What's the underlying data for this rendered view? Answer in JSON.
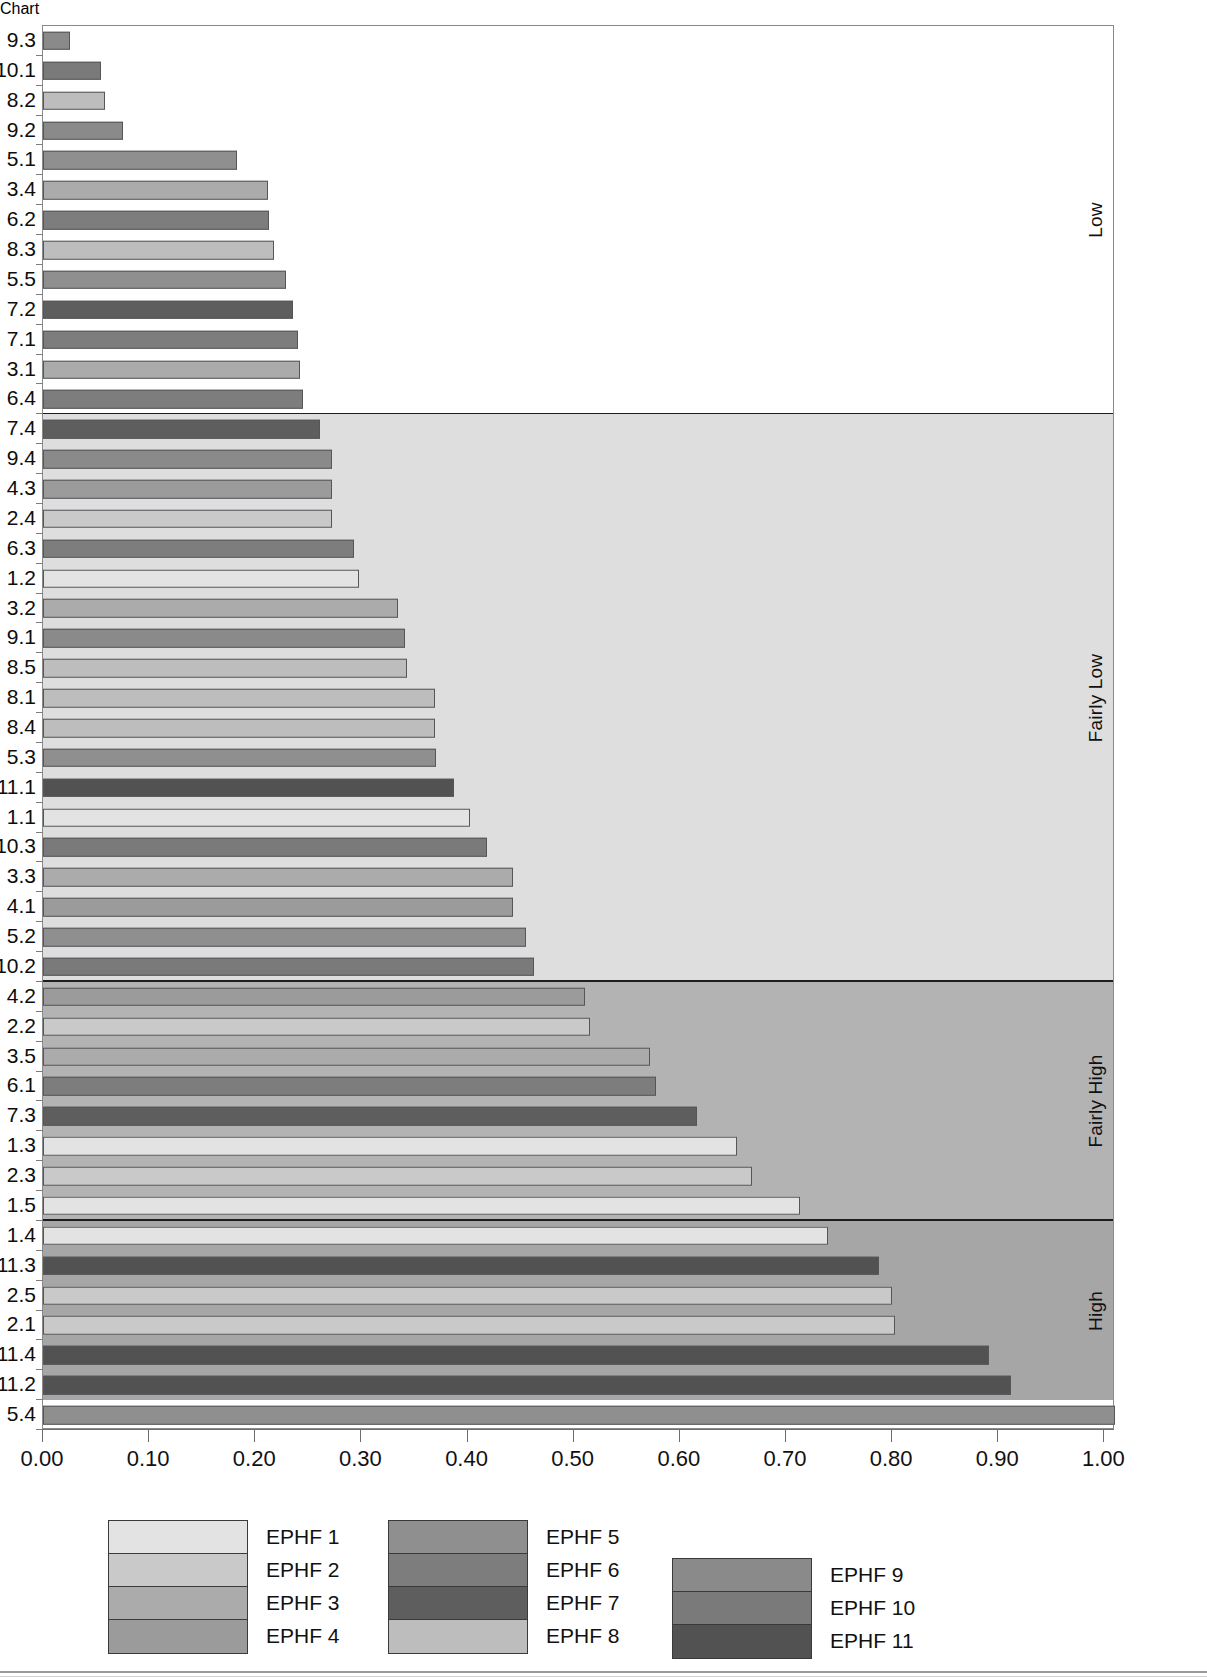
{
  "chart_data": {
    "type": "bar",
    "orientation": "horizontal",
    "title": "",
    "xlabel": "",
    "ylabel": "",
    "xlim": [
      0.0,
      1.01
    ],
    "grid": false,
    "legend_position": "bottom",
    "xticks": [
      "0.00",
      "0.10",
      "0.20",
      "0.30",
      "0.40",
      "0.50",
      "0.60",
      "0.70",
      "0.80",
      "0.90",
      "1.00"
    ],
    "xtick_values": [
      0.0,
      0.1,
      0.2,
      0.3,
      0.4,
      0.5,
      0.6,
      0.7,
      0.8,
      0.9,
      1.0
    ],
    "bands": [
      {
        "label": "Low",
        "color": "#ffffff",
        "count": 13
      },
      {
        "label": "Fairly Low",
        "color": "#dedede",
        "count": 19
      },
      {
        "label": "Fairly High",
        "color": "#b3b3b3",
        "count": 8
      },
      {
        "label": "High",
        "color": "#a6a6a6",
        "count": 6
      }
    ],
    "series_colors": {
      "EPHF 1": "#e3e3e3",
      "EPHF 2": "#c9c9c9",
      "EPHF 3": "#ababab",
      "EPHF 4": "#9b9b9b",
      "EPHF 5": "#8f8f8f",
      "EPHF 6": "#7d7d7d",
      "EPHF 7": "#5e5e5e",
      "EPHF 8": "#bdbdbd",
      "EPHF 9": "#8a8a8a",
      "EPHF 10": "#7a7a7a",
      "EPHF 11": "#525252"
    },
    "categories": [
      "9.3",
      "10.1",
      "8.2",
      "9.2",
      "5.1",
      "3.4",
      "6.2",
      "8.3",
      "5.5",
      "7.2",
      "7.1",
      "3.1",
      "6.4",
      "7.4",
      "9.4",
      "4.3",
      "2.4",
      "6.3",
      "1.2",
      "3.2",
      "9.1",
      "8.5",
      "8.1",
      "8.4",
      "5.3",
      "11.1",
      "1.1",
      "10.3",
      "3.3",
      "4.1",
      "5.2",
      "10.2",
      "4.2",
      "2.2",
      "3.5",
      "6.1",
      "7.3",
      "1.3",
      "2.3",
      "1.5",
      "1.4",
      "11.3",
      "2.5",
      "2.1",
      "11.4",
      "11.2",
      "5.4"
    ],
    "values": [
      0.025,
      0.055,
      0.058,
      0.075,
      0.183,
      0.212,
      0.213,
      0.218,
      0.229,
      0.236,
      0.24,
      0.242,
      0.245,
      0.261,
      0.272,
      0.272,
      0.272,
      0.293,
      0.298,
      0.334,
      0.341,
      0.343,
      0.369,
      0.369,
      0.37,
      0.387,
      0.402,
      0.418,
      0.443,
      0.443,
      0.455,
      0.463,
      0.511,
      0.515,
      0.572,
      0.578,
      0.616,
      0.654,
      0.668,
      0.713,
      0.74,
      0.788,
      0.8,
      0.803,
      0.891,
      0.912,
      1.01
    ],
    "series_of_bar": [
      "EPHF 9",
      "EPHF 10",
      "EPHF 8",
      "EPHF 9",
      "EPHF 5",
      "EPHF 3",
      "EPHF 6",
      "EPHF 8",
      "EPHF 5",
      "EPHF 7",
      "EPHF 6",
      "EPHF 3",
      "EPHF 6",
      "EPHF 7",
      "EPHF 9",
      "EPHF 4",
      "EPHF 2",
      "EPHF 6",
      "EPHF 1",
      "EPHF 3",
      "EPHF 9",
      "EPHF 8",
      "EPHF 8",
      "EPHF 8",
      "EPHF 5",
      "EPHF 11",
      "EPHF 1",
      "EPHF 10",
      "EPHF 3",
      "EPHF 4",
      "EPHF 5",
      "EPHF 10",
      "EPHF 4",
      "EPHF 2",
      "EPHF 3",
      "EPHF 6",
      "EPHF 7",
      "EPHF 1",
      "EPHF 2",
      "EPHF 1",
      "EPHF 1",
      "EPHF 11",
      "EPHF 2",
      "EPHF 2",
      "EPHF 11",
      "EPHF 11",
      "EPHF 5"
    ],
    "bars": [
      {
        "category": "9.3",
        "value": 0.025,
        "series": "EPHF 9",
        "band": "Low"
      },
      {
        "category": "10.1",
        "value": 0.055,
        "series": "EPHF 10",
        "band": "Low"
      },
      {
        "category": "8.2",
        "value": 0.058,
        "series": "EPHF 8",
        "band": "Low"
      },
      {
        "category": "9.2",
        "value": 0.075,
        "series": "EPHF 9",
        "band": "Low"
      },
      {
        "category": "5.1",
        "value": 0.183,
        "series": "EPHF 5",
        "band": "Low"
      },
      {
        "category": "3.4",
        "value": 0.212,
        "series": "EPHF 3",
        "band": "Low"
      },
      {
        "category": "6.2",
        "value": 0.213,
        "series": "EPHF 6",
        "band": "Low"
      },
      {
        "category": "8.3",
        "value": 0.218,
        "series": "EPHF 8",
        "band": "Low"
      },
      {
        "category": "5.5",
        "value": 0.229,
        "series": "EPHF 5",
        "band": "Low"
      },
      {
        "category": "7.2",
        "value": 0.236,
        "series": "EPHF 7",
        "band": "Low"
      },
      {
        "category": "7.1",
        "value": 0.24,
        "series": "EPHF 6",
        "band": "Low"
      },
      {
        "category": "3.1",
        "value": 0.242,
        "series": "EPHF 3",
        "band": "Low"
      },
      {
        "category": "6.4",
        "value": 0.245,
        "series": "EPHF 6",
        "band": "Low"
      },
      {
        "category": "7.4",
        "value": 0.261,
        "series": "EPHF 7",
        "band": "Fairly Low"
      },
      {
        "category": "9.4",
        "value": 0.272,
        "series": "EPHF 9",
        "band": "Fairly Low"
      },
      {
        "category": "4.3",
        "value": 0.272,
        "series": "EPHF 4",
        "band": "Fairly Low"
      },
      {
        "category": "2.4",
        "value": 0.272,
        "series": "EPHF 2",
        "band": "Fairly Low"
      },
      {
        "category": "6.3",
        "value": 0.293,
        "series": "EPHF 6",
        "band": "Fairly Low"
      },
      {
        "category": "1.2",
        "value": 0.298,
        "series": "EPHF 1",
        "band": "Fairly Low"
      },
      {
        "category": "3.2",
        "value": 0.334,
        "series": "EPHF 3",
        "band": "Fairly Low"
      },
      {
        "category": "9.1",
        "value": 0.341,
        "series": "EPHF 9",
        "band": "Fairly Low"
      },
      {
        "category": "8.5",
        "value": 0.343,
        "series": "EPHF 8",
        "band": "Fairly Low"
      },
      {
        "category": "8.1",
        "value": 0.369,
        "series": "EPHF 8",
        "band": "Fairly Low"
      },
      {
        "category": "8.4",
        "value": 0.369,
        "series": "EPHF 8",
        "band": "Fairly Low"
      },
      {
        "category": "5.3",
        "value": 0.37,
        "series": "EPHF 5",
        "band": "Fairly Low"
      },
      {
        "category": "11.1",
        "value": 0.387,
        "series": "EPHF 11",
        "band": "Fairly Low"
      },
      {
        "category": "1.1",
        "value": 0.402,
        "series": "EPHF 1",
        "band": "Fairly Low"
      },
      {
        "category": "10.3",
        "value": 0.418,
        "series": "EPHF 10",
        "band": "Fairly Low"
      },
      {
        "category": "3.3",
        "value": 0.443,
        "series": "EPHF 3",
        "band": "Fairly Low"
      },
      {
        "category": "4.1",
        "value": 0.443,
        "series": "EPHF 4",
        "band": "Fairly Low"
      },
      {
        "category": "5.2",
        "value": 0.455,
        "series": "EPHF 5",
        "band": "Fairly Low"
      },
      {
        "category": "10.2",
        "value": 0.463,
        "series": "EPHF 10",
        "band": "Fairly Low"
      },
      {
        "category": "4.2",
        "value": 0.511,
        "series": "EPHF 4",
        "band": "Fairly High"
      },
      {
        "category": "2.2",
        "value": 0.515,
        "series": "EPHF 2",
        "band": "Fairly High"
      },
      {
        "category": "3.5",
        "value": 0.572,
        "series": "EPHF 3",
        "band": "Fairly High"
      },
      {
        "category": "6.1",
        "value": 0.578,
        "series": "EPHF 6",
        "band": "Fairly High"
      },
      {
        "category": "7.3",
        "value": 0.616,
        "series": "EPHF 7",
        "band": "Fairly High"
      },
      {
        "category": "1.3",
        "value": 0.654,
        "series": "EPHF 1",
        "band": "Fairly High"
      },
      {
        "category": "2.3",
        "value": 0.668,
        "series": "EPHF 2",
        "band": "Fairly High"
      },
      {
        "category": "1.5",
        "value": 0.713,
        "series": "EPHF 1",
        "band": "Fairly High"
      },
      {
        "category": "1.4",
        "value": 0.74,
        "series": "EPHF 1",
        "band": "Fairly High"
      },
      {
        "category": "11.3",
        "value": 0.788,
        "series": "EPHF 11",
        "band": "High"
      },
      {
        "category": "2.5",
        "value": 0.8,
        "series": "EPHF 2",
        "band": "High"
      },
      {
        "category": "2.1",
        "value": 0.803,
        "series": "EPHF 2",
        "band": "High"
      },
      {
        "category": "11.4",
        "value": 0.891,
        "series": "EPHF 11",
        "band": "High"
      },
      {
        "category": "11.2",
        "value": 0.912,
        "series": "EPHF 11",
        "band": "High"
      },
      {
        "category": "5.4",
        "value": 1.01,
        "series": "EPHF 5",
        "band": "High"
      }
    ],
    "legend": {
      "groups": [
        {
          "items": [
            {
              "label": "EPHF 1",
              "color": "#e3e3e3"
            },
            {
              "label": "EPHF 2",
              "color": "#c9c9c9"
            },
            {
              "label": "EPHF 3",
              "color": "#ababab"
            },
            {
              "label": "EPHF 4",
              "color": "#9b9b9b"
            }
          ]
        },
        {
          "items": [
            {
              "label": "EPHF 5",
              "color": "#8f8f8f"
            },
            {
              "label": "EPHF 6",
              "color": "#7d7d7d"
            },
            {
              "label": "EPHF 7",
              "color": "#5e5e5e"
            },
            {
              "label": "EPHF 8",
              "color": "#bdbdbd"
            }
          ]
        },
        {
          "items": [
            {
              "label": "EPHF 9",
              "color": "#8a8a8a"
            },
            {
              "label": "EPHF 10",
              "color": "#7a7a7a"
            },
            {
              "label": "EPHF 11",
              "color": "#525252"
            }
          ]
        }
      ]
    }
  }
}
